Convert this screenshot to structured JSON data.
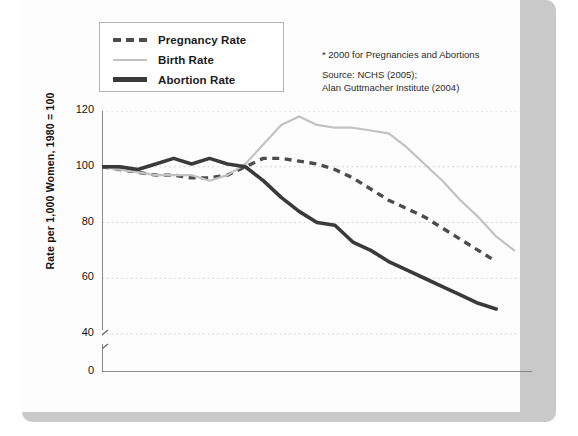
{
  "legend": {
    "items": [
      {
        "label": "Pregnancy Rate",
        "style": "dashed",
        "color": "#4c4c4c",
        "icon": "dashed-line-swatch"
      },
      {
        "label": "Birth Rate",
        "style": "solid-thin",
        "color": "#c2c2c2",
        "icon": "thin-line-swatch"
      },
      {
        "label": "Abortion Rate",
        "style": "solid-thick",
        "color": "#3a3a3a",
        "icon": "thick-line-swatch"
      }
    ]
  },
  "note": {
    "line1": "* 2000 for Pregnancies and Abortions",
    "line2": "Source: NCHS (2005);",
    "line3": "Alan Guttmacher Institute (2004)"
  },
  "axes": {
    "ylabel": "Rate per 1,000 Women, 1980 = 100",
    "yticks": [
      "120",
      "100",
      "80",
      "60",
      "40",
      "0"
    ],
    "xticks": [
      "1980",
      "1982",
      "1984",
      "1986",
      "1988",
      "1990",
      "1992",
      "1994",
      "1996",
      "1998",
      "2000",
      "2002"
    ]
  },
  "chart_data": {
    "type": "line",
    "title": "",
    "xlabel": "",
    "ylabel": "Rate per 1,000 Women, 1980 = 100",
    "xlim": [
      1980,
      2004
    ],
    "ylim": [
      40,
      120
    ],
    "y_axis_break": true,
    "y_break_between": [
      0,
      40
    ],
    "grid": "horizontal-dotted",
    "legend_position": "top-left",
    "x": [
      1980,
      1981,
      1982,
      1983,
      1984,
      1985,
      1986,
      1987,
      1988,
      1989,
      1990,
      1991,
      1992,
      1993,
      1994,
      1995,
      1996,
      1997,
      1998,
      1999,
      2000,
      2001,
      2002,
      2003
    ],
    "series": [
      {
        "name": "Pregnancy Rate",
        "style": "dashed",
        "color": "#4c4c4c",
        "values": [
          100,
          99,
          98,
          97,
          97,
          96,
          96,
          97,
          100,
          103,
          103,
          102,
          101,
          99,
          96,
          92,
          88,
          85,
          82,
          78,
          74,
          70,
          66,
          null
        ]
      },
      {
        "name": "Birth Rate",
        "style": "solid-thin",
        "color": "#c2c2c2",
        "values": [
          100,
          99,
          98,
          97,
          97,
          97,
          95,
          97,
          101,
          108,
          115,
          118,
          115,
          114,
          114,
          113,
          112,
          107,
          101,
          95,
          88,
          82,
          75,
          70
        ]
      },
      {
        "name": "Abortion Rate",
        "style": "solid-thick",
        "color": "#3a3a3a",
        "values": [
          100,
          100,
          99,
          101,
          103,
          101,
          103,
          101,
          100,
          95,
          89,
          84,
          80,
          79,
          73,
          70,
          66,
          63,
          60,
          57,
          54,
          51,
          49,
          null
        ]
      }
    ]
  }
}
